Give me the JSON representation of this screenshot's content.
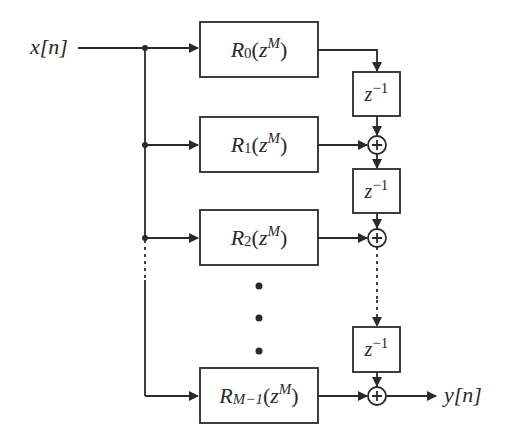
{
  "diagram": {
    "type": "polyphase-decomposition-block-diagram",
    "input": {
      "label": "x[n]"
    },
    "output": {
      "label": "y[n]"
    },
    "branches": [
      {
        "filter": "R",
        "index": "0",
        "arg_base": "z",
        "arg_exp": "M"
      },
      {
        "filter": "R",
        "index": "1",
        "arg_base": "z",
        "arg_exp": "M"
      },
      {
        "filter": "R",
        "index": "2",
        "arg_base": "z",
        "arg_exp": "M"
      },
      {
        "filter": "R",
        "index": "M−1",
        "arg_base": "z",
        "arg_exp": "M"
      }
    ],
    "delays": [
      {
        "base": "z",
        "exp": "−1"
      },
      {
        "base": "z",
        "exp": "−1"
      },
      {
        "base": "z",
        "exp": "−1"
      }
    ],
    "adders": [
      {
        "symbol": "+"
      },
      {
        "symbol": "+"
      },
      {
        "symbol": "+"
      }
    ],
    "ellipsis": "• • •",
    "colors": {
      "stroke": "#2a2a2a",
      "background": "#ffffff"
    }
  }
}
